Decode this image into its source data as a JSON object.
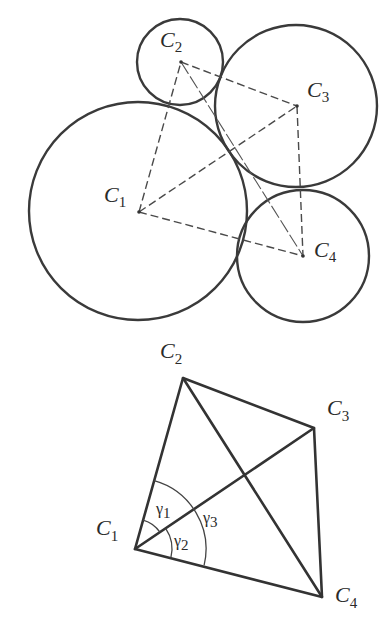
{
  "figure_top": {
    "description": "Four mutually tangent circles with dashed lines connecting centers",
    "circles": [
      {
        "id": "C1",
        "cx": 138,
        "cy": 211,
        "r": 109
      },
      {
        "id": "C2",
        "cx": 180,
        "cy": 62,
        "r": 43
      },
      {
        "id": "C3",
        "cx": 296,
        "cy": 106,
        "r": 81
      },
      {
        "id": "C4",
        "cx": 303,
        "cy": 256,
        "r": 66
      }
    ],
    "labels": {
      "c1": {
        "main": "C",
        "sub": "1"
      },
      "c2": {
        "main": "C",
        "sub": "2"
      },
      "c3": {
        "main": "C",
        "sub": "3"
      },
      "c4": {
        "main": "C",
        "sub": "4"
      }
    },
    "connections": [
      "C1-C2",
      "C1-C3",
      "C1-C4",
      "C2-C3",
      "C3-C4",
      "C2-C4"
    ]
  },
  "figure_bottom": {
    "description": "Quadrilateral C1C2C3C4 with diagonals and angles at C1",
    "vertices": {
      "C1": [
        135,
        549
      ],
      "C2": [
        183,
        378
      ],
      "C3": [
        314,
        428
      ],
      "C4": [
        322,
        597
      ]
    },
    "labels": {
      "c1": {
        "main": "C",
        "sub": "1"
      },
      "c2": {
        "main": "C",
        "sub": "2"
      },
      "c3": {
        "main": "C",
        "sub": "3"
      },
      "c4": {
        "main": "C",
        "sub": "4"
      }
    },
    "angles": {
      "gamma1": {
        "symbol": "γ",
        "sub": "1"
      },
      "gamma2": {
        "symbol": "γ",
        "sub": "2"
      },
      "gamma3": {
        "symbol": "γ",
        "sub": "3"
      }
    }
  },
  "colors": {
    "background": "#ffffff",
    "stroke": "#333333"
  }
}
